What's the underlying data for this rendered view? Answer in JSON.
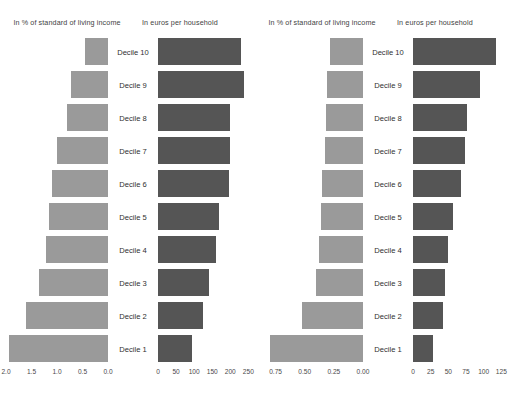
{
  "chart_data": [
    {
      "type": "bar",
      "panel_id": "left-percent",
      "title": "In % of standard of living income",
      "orientation": "horizontal",
      "direction": "right-to-left",
      "categories": [
        "Decile 10",
        "Decile 9",
        "Decile 8",
        "Decile 7",
        "Decile 6",
        "Decile 5",
        "Decile 4",
        "Decile 3",
        "Decile 2",
        "Decile 1"
      ],
      "values": [
        0.45,
        0.72,
        0.8,
        1.0,
        1.1,
        1.15,
        1.22,
        1.35,
        1.6,
        1.95
      ],
      "xlabel": "",
      "ylabel": "",
      "xlim": [
        2.0,
        0.0
      ],
      "ticks": [
        "2.0",
        "1.5",
        "1.0",
        "0.5",
        "0.0"
      ],
      "tick_values": [
        2.0,
        1.5,
        1.0,
        0.5,
        0.0
      ],
      "grid": false,
      "bar_color": "#9a9a9a"
    },
    {
      "type": "bar",
      "panel_id": "left-euros",
      "title": "In euros per household",
      "orientation": "horizontal",
      "direction": "left-to-right",
      "categories": [
        "Decile 10",
        "Decile 9",
        "Decile 8",
        "Decile 7",
        "Decile 6",
        "Decile 5",
        "Decile 4",
        "Decile 3",
        "Decile 2",
        "Decile 1"
      ],
      "values": [
        230,
        238,
        200,
        198,
        196,
        168,
        160,
        140,
        125,
        95
      ],
      "xlabel": "",
      "ylabel": "",
      "xlim": [
        0,
        260
      ],
      "ticks": [
        "0",
        "50",
        "100",
        "150",
        "200",
        "250"
      ],
      "tick_values": [
        0,
        50,
        100,
        150,
        200,
        250
      ],
      "grid": false,
      "bar_color": "#555555"
    },
    {
      "type": "bar",
      "panel_id": "right-percent",
      "title": "In % of standard of living income",
      "orientation": "horizontal",
      "direction": "right-to-left",
      "categories": [
        "Decile 10",
        "Decile 9",
        "Decile 8",
        "Decile 7",
        "Decile 6",
        "Decile 5",
        "Decile 4",
        "Decile 3",
        "Decile 2",
        "Decile 1"
      ],
      "values": [
        0.28,
        0.31,
        0.32,
        0.33,
        0.35,
        0.36,
        0.38,
        0.4,
        0.52,
        0.8
      ],
      "xlabel": "",
      "ylabel": "",
      "xlim": [
        0.875,
        0.0
      ],
      "ticks": [
        "0.75",
        "0.50",
        "0.25",
        "0.00"
      ],
      "tick_values": [
        0.75,
        0.5,
        0.25,
        0.0
      ],
      "grid": false,
      "bar_color": "#9a9a9a"
    },
    {
      "type": "bar",
      "panel_id": "right-euros",
      "title": "In euros per household",
      "orientation": "horizontal",
      "direction": "left-to-right",
      "categories": [
        "Decile 10",
        "Decile 9",
        "Decile 8",
        "Decile 7",
        "Decile 6",
        "Decile 5",
        "Decile 4",
        "Decile 3",
        "Decile 2",
        "Decile 1"
      ],
      "values": [
        118,
        95,
        77,
        73,
        68,
        56,
        50,
        45,
        42,
        28
      ],
      "xlabel": "",
      "ylabel": "",
      "xlim": [
        0,
        133
      ],
      "ticks": [
        "0",
        "25",
        "50",
        "75",
        "100",
        "125"
      ],
      "tick_values": [
        0,
        25,
        50,
        75,
        100,
        125
      ],
      "grid": false,
      "bar_color": "#555555"
    }
  ]
}
